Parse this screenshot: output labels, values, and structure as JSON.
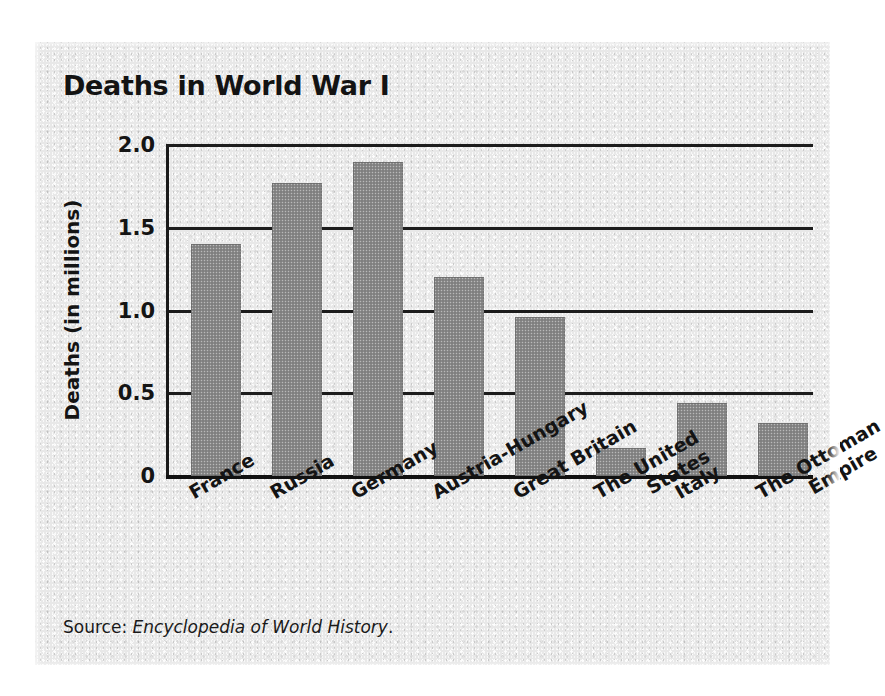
{
  "chart_data": {
    "type": "bar",
    "title": "Deaths in World War I",
    "xlabel": "",
    "ylabel": "Deaths (in millions)",
    "categories": [
      "France",
      "Russia",
      "Germany",
      "Austria-Hungary",
      "Great Britain",
      "The United States",
      "Italy",
      "The Ottoman Empire"
    ],
    "category_lines": [
      [
        "France"
      ],
      [
        "Russia"
      ],
      [
        "Germany"
      ],
      [
        "Austria-Hungary"
      ],
      [
        "Great Britain"
      ],
      [
        "The United",
        "States"
      ],
      [
        "Italy"
      ],
      [
        "The Ottoman",
        "Empire"
      ]
    ],
    "values": [
      1.4,
      1.77,
      1.9,
      1.2,
      0.96,
      0.17,
      0.44,
      0.32
    ],
    "ylim": [
      0,
      2.0
    ],
    "ytick_values": [
      2.0,
      1.5,
      1.0,
      0.5,
      0
    ],
    "ytick_labels": [
      "2.0",
      "1.5",
      "1.0",
      "0.5",
      "0"
    ],
    "grid": true,
    "legend": false,
    "bar_color": "#8a8a8a",
    "axis_color": "#1a1a1a",
    "background_color": "#e8e8e8"
  },
  "source": {
    "prefix": "Source: ",
    "work": "Encyclopedia of World History",
    "suffix": "."
  }
}
